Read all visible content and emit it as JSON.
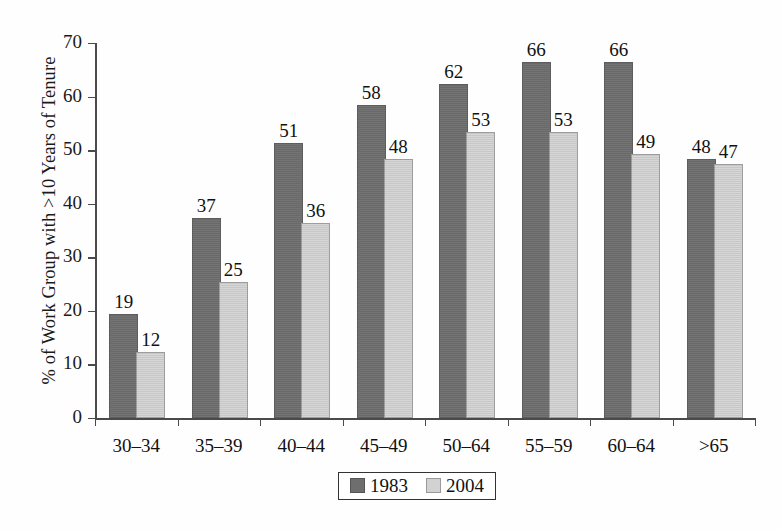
{
  "chart_data": {
    "type": "bar",
    "title": "",
    "xlabel": "",
    "ylabel": "% of Work Group with >10 Years of Tenure",
    "ylim": [
      0,
      70
    ],
    "yticks": [
      0,
      10,
      20,
      30,
      40,
      50,
      60,
      70
    ],
    "grid": false,
    "legend_position": "bottom-center",
    "categories": [
      "30–34",
      "35–39",
      "40–44",
      "45–49",
      "50–64",
      "55–59",
      "60–64",
      ">65"
    ],
    "series": [
      {
        "name": "1983",
        "color": "#6e6e6e",
        "values": [
          19,
          37,
          51,
          58,
          62,
          66,
          66,
          48
        ]
      },
      {
        "name": "2004",
        "color": "#d2d2d2",
        "values": [
          12,
          25,
          36,
          48,
          53,
          53,
          49,
          47
        ]
      }
    ]
  },
  "legend": {
    "entries": [
      {
        "label": "1983",
        "swatch": "dark-gray-swatch"
      },
      {
        "label": "2004",
        "swatch": "light-gray-swatch"
      }
    ]
  }
}
